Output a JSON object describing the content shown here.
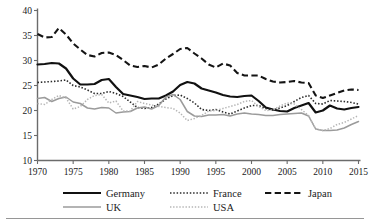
{
  "chart_data": {
    "type": "line",
    "title": "",
    "subtitle": "",
    "xlabel": "",
    "ylabel": "",
    "xlim": [
      1970,
      2015
    ],
    "ylim": [
      10,
      40
    ],
    "grid": false,
    "legend_position": "bottom",
    "xticks": [
      1970,
      1975,
      1980,
      1985,
      1990,
      1995,
      2000,
      2005,
      2010,
      2015
    ],
    "yticks": [
      10,
      15,
      20,
      25,
      30,
      35,
      40
    ],
    "x": [
      1970,
      1971,
      1972,
      1973,
      1974,
      1975,
      1976,
      1977,
      1978,
      1979,
      1980,
      1981,
      1982,
      1983,
      1984,
      1985,
      1986,
      1987,
      1988,
      1989,
      1990,
      1991,
      1992,
      1993,
      1994,
      1995,
      1996,
      1997,
      1998,
      1999,
      2000,
      2001,
      2002,
      2003,
      2004,
      2005,
      2006,
      2007,
      2008,
      2009,
      2010,
      2011,
      2012,
      2013,
      2014,
      2015
    ],
    "series": [
      {
        "name": "Germany",
        "color": "#111111",
        "style": "solid",
        "width": 2.2,
        "values": [
          29.2,
          29.3,
          29.5,
          29.4,
          28.4,
          26.4,
          25.2,
          25.2,
          25.3,
          26.1,
          26.3,
          24.7,
          23.3,
          23.0,
          22.7,
          22.3,
          22.4,
          22.4,
          23.0,
          23.8,
          25.1,
          25.7,
          25.4,
          24.4,
          24.0,
          23.6,
          23.1,
          22.8,
          22.7,
          22.9,
          23.0,
          21.9,
          20.6,
          20.2,
          19.9,
          19.8,
          20.5,
          21.0,
          21.5,
          19.6,
          20.0,
          21.0,
          20.4,
          20.2,
          20.5,
          20.7
        ]
      },
      {
        "name": "France",
        "color": "#2b2b2b",
        "style": "dotted",
        "width": 1.6,
        "values": [
          25.6,
          25.7,
          25.8,
          25.9,
          26.1,
          25.0,
          24.7,
          24.1,
          23.4,
          23.4,
          23.8,
          23.4,
          22.8,
          21.7,
          20.6,
          20.4,
          20.6,
          21.3,
          22.3,
          23.0,
          23.1,
          22.4,
          21.5,
          20.2,
          20.0,
          20.2,
          19.7,
          19.3,
          19.9,
          20.5,
          21.0,
          21.0,
          20.4,
          20.1,
          20.5,
          21.0,
          21.8,
          22.6,
          23.0,
          21.4,
          21.3,
          22.0,
          21.9,
          21.8,
          21.6,
          21.3
        ]
      },
      {
        "name": "Japan",
        "color": "#141414",
        "style": "dashed",
        "width": 2.1,
        "values": [
          35.3,
          34.6,
          34.7,
          36.5,
          35.2,
          33.4,
          32.2,
          31.1,
          30.8,
          31.5,
          31.6,
          31.1,
          30.1,
          29.0,
          28.7,
          28.9,
          28.6,
          29.2,
          30.4,
          31.3,
          32.3,
          32.5,
          31.4,
          30.4,
          29.2,
          28.6,
          29.4,
          29.0,
          27.5,
          27.0,
          27.0,
          27.0,
          26.3,
          25.8,
          25.6,
          25.7,
          25.9,
          25.6,
          25.5,
          23.0,
          22.5,
          23.0,
          23.5,
          24.0,
          24.2,
          24.1
        ]
      },
      {
        "name": "UK",
        "color": "#9b9b9b",
        "style": "solid",
        "width": 1.5,
        "values": [
          22.4,
          22.6,
          21.8,
          22.4,
          22.7,
          21.7,
          21.4,
          20.5,
          20.3,
          20.6,
          20.5,
          19.5,
          19.7,
          19.8,
          20.5,
          20.7,
          20.3,
          21.0,
          22.7,
          23.2,
          22.2,
          19.8,
          18.9,
          18.8,
          19.1,
          19.1,
          19.2,
          18.9,
          19.3,
          19.5,
          19.3,
          19.2,
          19.0,
          19.0,
          19.2,
          19.3,
          19.4,
          19.5,
          18.9,
          16.3,
          16.0,
          16.0,
          16.1,
          16.5,
          17.2,
          17.8
        ]
      },
      {
        "name": "USA",
        "color": "#b5b5b5",
        "style": "dotted",
        "width": 1.5,
        "values": [
          21.4,
          21.2,
          22.2,
          23.0,
          22.5,
          20.3,
          20.8,
          22.2,
          23.0,
          23.2,
          21.5,
          21.9,
          19.9,
          19.9,
          21.8,
          21.4,
          21.1,
          20.8,
          20.6,
          20.4,
          19.5,
          18.0,
          18.4,
          19.0,
          19.9,
          20.0,
          20.4,
          20.8,
          21.2,
          21.8,
          22.0,
          20.8,
          20.0,
          20.1,
          20.9,
          21.5,
          21.3,
          20.2,
          19.0,
          16.3,
          16.0,
          16.4,
          17.2,
          17.6,
          18.3,
          19.0
        ]
      }
    ]
  },
  "axes": {
    "y_tick_labels": [
      "40",
      "35",
      "30",
      "25",
      "20",
      "15",
      "10"
    ],
    "x_tick_labels": [
      "1970",
      "1975",
      "1980",
      "1985",
      "1990",
      "1995",
      "2000",
      "2005",
      "2010",
      "2015"
    ]
  },
  "legend": {
    "row1": [
      {
        "label": "Germany",
        "key": "germany"
      },
      {
        "label": "France",
        "key": "france"
      },
      {
        "label": "Japan",
        "key": "japan"
      }
    ],
    "row2": [
      {
        "label": "UK",
        "key": "uk"
      },
      {
        "label": "USA",
        "key": "usa"
      }
    ]
  }
}
